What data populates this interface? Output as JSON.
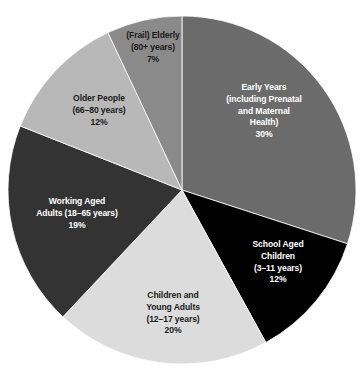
{
  "chart_data": {
    "type": "pie",
    "title": "",
    "legend_position": "none",
    "start_angle_deg": 0,
    "direction": "clockwise",
    "categories": [
      "Early Years (including Prenatal and Maternal Health)",
      "School Aged Children (3–11 years)",
      "Children and Young Adults (12–17 years)",
      "Working Aged Adults (18–65 years)",
      "Older People (66–80 years)",
      "(Frail) Elderly (80+ years)"
    ],
    "values": [
      30,
      12,
      20,
      19,
      12,
      7
    ],
    "value_unit": "%",
    "colors": [
      "#6b6b6b",
      "#000000",
      "#dcdcdc",
      "#333333",
      "#b8b8b8",
      "#8a8a8a"
    ],
    "slices": [
      {
        "name": "early-years",
        "percent_label": "30%",
        "value": 30,
        "color": "#6b6b6b",
        "text_color": "#ffffff",
        "lines": [
          "Early Years",
          "(including Prenatal",
          "and Maternal",
          "Health)",
          "30%"
        ],
        "label_x": 264,
        "label_y": 88
      },
      {
        "name": "school-aged-children",
        "percent_label": "12%",
        "value": 12,
        "color": "#000000",
        "text_color": "#ffffff",
        "lines": [
          "School Aged",
          "Children",
          "(3–11 years)",
          "12%"
        ],
        "label_x": 278,
        "label_y": 245
      },
      {
        "name": "children-and-young-adults",
        "percent_label": "20%",
        "value": 20,
        "color": "#dcdcdc",
        "text_color": "#1a1a1a",
        "lines": [
          "Children and",
          "Young Adults",
          "(12–17 years)",
          "20%"
        ],
        "label_x": 173,
        "label_y": 296
      },
      {
        "name": "working-aged-adults",
        "percent_label": "19%",
        "value": 19,
        "color": "#333333",
        "text_color": "#ffffff",
        "lines": [
          "Working Aged",
          "Adults (18–65 years)",
          "19%"
        ],
        "label_x": 77,
        "label_y": 202
      },
      {
        "name": "older-people",
        "percent_label": "12%",
        "value": 12,
        "color": "#b8b8b8",
        "text_color": "#1a1a1a",
        "lines": [
          "Older People",
          "(66–80 years)",
          "12%"
        ],
        "label_x": 99,
        "label_y": 99
      },
      {
        "name": "frail-elderly",
        "percent_label": "7%",
        "value": 7,
        "color": "#8a8a8a",
        "text_color": "#1a1a1a",
        "lines": [
          "(Frail) Elderly",
          "(80+ years)",
          "7%"
        ],
        "label_x": 153,
        "label_y": 36
      }
    ],
    "geometry": {
      "center_x": 182,
      "center_y": 190,
      "radius": 174
    },
    "background_color": "#ffffff"
  }
}
